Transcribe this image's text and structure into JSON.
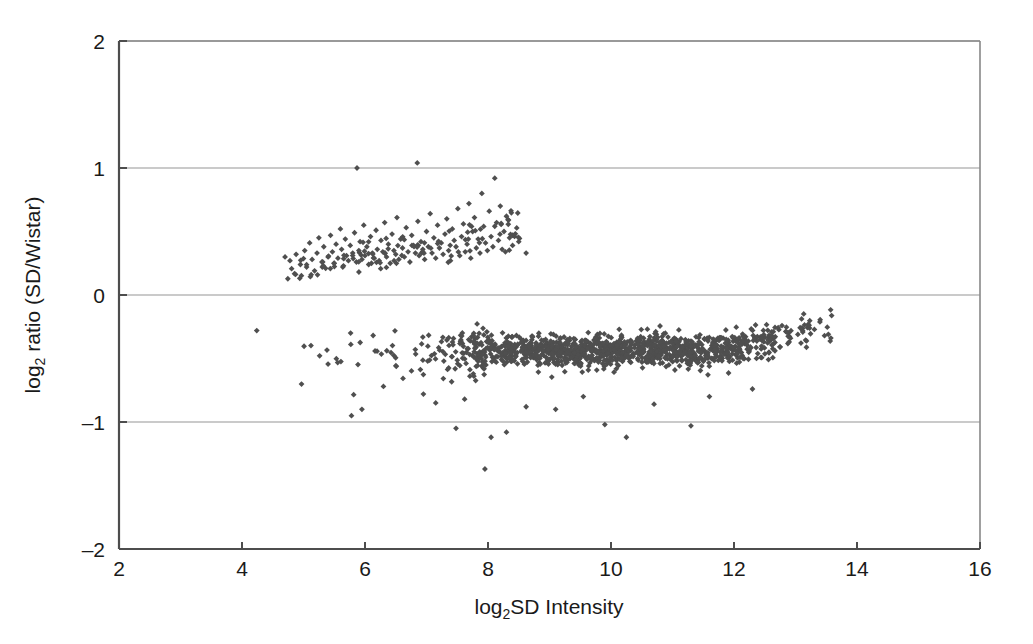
{
  "figure": {
    "background_color": "#ffffff",
    "marker_color": "#4f4f4f",
    "gridline_color": "#b9b9b9",
    "axis_color": "#4d4d4d"
  },
  "axes": {
    "x_title_main": "SD Intensity",
    "x_title_prefix": "log",
    "x_title_sub": "2",
    "y_title_main": " ratio (SD/Wistar)",
    "y_title_prefix": "log",
    "y_title_sub": "2",
    "x_ticks": [
      "2",
      "4",
      "6",
      "8",
      "10",
      "12",
      "14",
      "16"
    ],
    "y_ticks": [
      "2",
      "1",
      "0",
      "–1",
      "–2"
    ]
  },
  "chart_data": {
    "type": "scatter",
    "title": "",
    "xlabel": "log2 SD Intensity",
    "ylabel": "log2 ratio (SD/Wistar)",
    "xlim": [
      2,
      16
    ],
    "ylim": [
      -2,
      2
    ],
    "xticks": [
      2,
      4,
      6,
      8,
      10,
      12,
      14,
      16
    ],
    "yticks": [
      -2,
      -1,
      0,
      1,
      2
    ],
    "grid": "horizontal-gridlines-at-yticks",
    "legend": "none",
    "marker": "diamond",
    "marker_color": "#4f4f4f",
    "marker_size_px": 5,
    "series": [
      {
        "name": "upper cluster (SD-enriched clones)",
        "description": "Sparse upward-sloping band of points centred near log2 ratio +0.35, spanning log2 intensity 4.6 to 8.7",
        "n_points": 215,
        "x_range": [
          4.6,
          8.7
        ],
        "y_range": [
          0.12,
          1.05
        ],
        "trend": "ratio rises from ~0.25 at x=5 to ~0.55 at x=8",
        "points": [
          [
            4.7,
            0.3
          ],
          [
            4.78,
            0.27
          ],
          [
            4.88,
            0.32
          ],
          [
            4.95,
            0.24
          ],
          [
            5.02,
            0.35
          ],
          [
            5.05,
            0.22
          ],
          [
            5.1,
            0.41
          ],
          [
            5.14,
            0.28
          ],
          [
            5.18,
            0.19
          ],
          [
            5.22,
            0.33
          ],
          [
            5.25,
            0.45
          ],
          [
            5.3,
            0.26
          ],
          [
            5.33,
            0.38
          ],
          [
            5.36,
            0.21
          ],
          [
            5.4,
            0.3
          ],
          [
            5.44,
            0.47
          ],
          [
            5.47,
            0.34
          ],
          [
            5.5,
            0.25
          ],
          [
            5.53,
            0.4
          ],
          [
            5.56,
            0.29
          ],
          [
            5.6,
            0.52
          ],
          [
            5.62,
            0.36
          ],
          [
            5.65,
            0.23
          ],
          [
            5.68,
            0.44
          ],
          [
            5.7,
            0.31
          ],
          [
            5.73,
            0.27
          ],
          [
            5.76,
            0.39
          ],
          [
            5.8,
            0.33
          ],
          [
            5.83,
            0.49
          ],
          [
            5.86,
            0.26
          ],
          [
            5.87,
            1.0
          ],
          [
            5.9,
            0.35
          ],
          [
            5.92,
            0.42
          ],
          [
            5.95,
            0.28
          ],
          [
            5.98,
            0.55
          ],
          [
            6.0,
            0.31
          ],
          [
            6.03,
            0.38
          ],
          [
            6.06,
            0.24
          ],
          [
            6.09,
            0.46
          ],
          [
            6.12,
            0.33
          ],
          [
            6.15,
            0.29
          ],
          [
            6.18,
            0.51
          ],
          [
            6.2,
            0.36
          ],
          [
            6.23,
            0.27
          ],
          [
            6.26,
            0.43
          ],
          [
            6.29,
            0.34
          ],
          [
            6.32,
            0.57
          ],
          [
            6.35,
            0.3
          ],
          [
            6.38,
            0.4
          ],
          [
            6.41,
            0.25
          ],
          [
            6.44,
            0.48
          ],
          [
            6.47,
            0.35
          ],
          [
            6.5,
            0.32
          ],
          [
            6.52,
            0.61
          ],
          [
            6.55,
            0.28
          ],
          [
            6.58,
            0.44
          ],
          [
            6.61,
            0.37
          ],
          [
            6.64,
            0.3
          ],
          [
            6.67,
            0.53
          ],
          [
            6.7,
            0.34
          ],
          [
            6.73,
            0.26
          ],
          [
            6.76,
            0.47
          ],
          [
            6.79,
            0.39
          ],
          [
            6.82,
            0.33
          ],
          [
            6.85,
            1.04
          ],
          [
            6.86,
            0.58
          ],
          [
            6.88,
            0.31
          ],
          [
            6.91,
            0.42
          ],
          [
            6.94,
            0.36
          ],
          [
            6.97,
            0.28
          ],
          [
            7.0,
            0.5
          ],
          [
            7.03,
            0.38
          ],
          [
            7.06,
            0.64
          ],
          [
            7.09,
            0.33
          ],
          [
            7.12,
            0.45
          ],
          [
            7.15,
            0.29
          ],
          [
            7.18,
            0.55
          ],
          [
            7.21,
            0.37
          ],
          [
            7.24,
            0.41
          ],
          [
            7.27,
            0.32
          ],
          [
            7.3,
            0.48
          ],
          [
            7.33,
            0.6
          ],
          [
            7.36,
            0.35
          ],
          [
            7.39,
            0.27
          ],
          [
            7.42,
            0.52
          ],
          [
            7.45,
            0.43
          ],
          [
            7.48,
            0.38
          ],
          [
            7.51,
            0.68
          ],
          [
            7.54,
            0.31
          ],
          [
            7.57,
            0.46
          ],
          [
            7.6,
            0.56
          ],
          [
            7.63,
            0.34
          ],
          [
            7.66,
            0.4
          ],
          [
            7.69,
            0.72
          ],
          [
            7.72,
            0.29
          ],
          [
            7.75,
            0.5
          ],
          [
            7.78,
            0.61
          ],
          [
            7.81,
            0.37
          ],
          [
            7.84,
            0.44
          ],
          [
            7.87,
            0.33
          ],
          [
            7.9,
            0.8
          ],
          [
            7.93,
            0.54
          ],
          [
            7.96,
            0.41
          ],
          [
            7.99,
            0.35
          ],
          [
            8.02,
            0.66
          ],
          [
            8.05,
            0.46
          ],
          [
            8.08,
            0.38
          ],
          [
            8.11,
            0.92
          ],
          [
            8.14,
            0.57
          ],
          [
            8.17,
            0.43
          ],
          [
            8.2,
            0.7
          ],
          [
            8.23,
            0.36
          ],
          [
            8.26,
            0.5
          ],
          [
            8.3,
            0.62
          ],
          [
            8.35,
            0.45
          ],
          [
            8.4,
            0.39
          ],
          [
            8.5,
            0.42
          ],
          [
            8.62,
            0.33
          ]
        ]
      },
      {
        "name": "main cluster (bulk clones)",
        "description": "Dense horizontal band centred near log2 ratio -0.42, spanning log2 intensity 4.9 to 13.7, drifting up toward -0.2 at the high-intensity end",
        "n_points": 1800,
        "x_range": [
          4.9,
          13.75
        ],
        "y_range": [
          -1.4,
          -0.12
        ],
        "trend": "flat near -0.45 from x=7 to x=12, rising to ~-0.2 by x=13.6",
        "center_y": -0.42,
        "points_note": "dense band rendered procedurally from the density profile below",
        "density_profile": [
          {
            "x": 5.0,
            "count": 4
          },
          {
            "x": 5.5,
            "count": 6
          },
          {
            "x": 6.0,
            "count": 8
          },
          {
            "x": 6.5,
            "count": 10
          },
          {
            "x": 7.0,
            "count": 18
          },
          {
            "x": 7.5,
            "count": 45
          },
          {
            "x": 8.0,
            "count": 90
          },
          {
            "x": 8.5,
            "count": 110
          },
          {
            "x": 9.0,
            "count": 130
          },
          {
            "x": 9.5,
            "count": 140
          },
          {
            "x": 10.0,
            "count": 145
          },
          {
            "x": 10.5,
            "count": 140
          },
          {
            "x": 11.0,
            "count": 130
          },
          {
            "x": 11.5,
            "count": 115
          },
          {
            "x": 12.0,
            "count": 95
          },
          {
            "x": 12.5,
            "count": 60
          },
          {
            "x": 13.0,
            "count": 30
          },
          {
            "x": 13.5,
            "count": 10
          }
        ]
      },
      {
        "name": "low-ratio outliers",
        "description": "Scattered individual points below the main band",
        "n_points": 20,
        "points": [
          [
            4.24,
            -0.28
          ],
          [
            5.78,
            -0.95
          ],
          [
            5.95,
            -0.9
          ],
          [
            6.3,
            -0.72
          ],
          [
            6.95,
            -0.78
          ],
          [
            7.15,
            -0.85
          ],
          [
            7.48,
            -1.05
          ],
          [
            7.62,
            -0.82
          ],
          [
            7.95,
            -1.37
          ],
          [
            8.05,
            -1.12
          ],
          [
            8.3,
            -1.08
          ],
          [
            8.62,
            -0.88
          ],
          [
            9.1,
            -0.9
          ],
          [
            9.55,
            -0.8
          ],
          [
            9.9,
            -1.02
          ],
          [
            10.25,
            -1.12
          ],
          [
            10.7,
            -0.86
          ],
          [
            11.3,
            -1.03
          ],
          [
            11.6,
            -0.8
          ],
          [
            12.3,
            -0.74
          ]
        ]
      }
    ]
  }
}
